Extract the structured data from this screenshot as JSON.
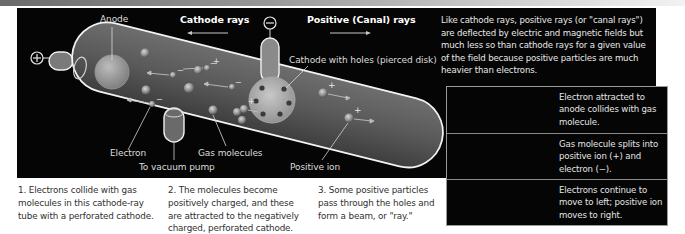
{
  "figure": {
    "labels": {
      "anode": "Anode",
      "cathode_rays": "Cathode rays",
      "positive_rays": "Positive (Canal) rays",
      "cathode_with_holes": "Cathode with holes (pierced disk)",
      "electron": "Electron",
      "gas_molecules": "Gas molecules",
      "vacuum_pump": "To vacuum pump",
      "positive_ion": "Positive ion",
      "anode_terminal": "+",
      "cathode_terminal": "−"
    },
    "intro_text": "Like cathode rays, positive rays (or \"canal rays\") are deflected by electric and magnetic fields but much less so than cathode rays for a given value of the field because positive particles are much heavier than electrons.",
    "inset_steps": [
      {
        "text": "Electron attracted to anode collides with gas molecule."
      },
      {
        "text": "Gas molecule splits into positive ion (+) and electron (−)."
      },
      {
        "text": "Electrons continue to move to left; positive ion moves to right."
      }
    ],
    "captions": [
      {
        "text": "1. Electrons collide with gas molecules in this cathode-ray tube with a perforated cathode."
      },
      {
        "text": "2. The molecules become positively charged, and these are attracted to the negatively charged, perforated cathode."
      },
      {
        "text": "3. Some positive particles pass through the holes and form a beam, or \"ray.\""
      }
    ],
    "colors": {
      "background": "#050505",
      "tube_fill": "#5a5a5a",
      "tube_outline": "#f0f0f0",
      "label_text": "#dcdcdc",
      "caption_text": "#303030"
    }
  }
}
